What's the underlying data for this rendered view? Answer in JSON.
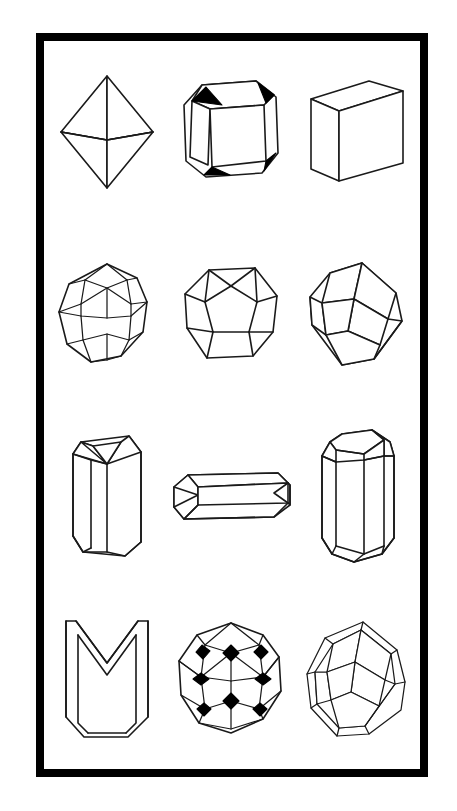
{
  "plate": {
    "background_color": "#ffffff",
    "frame_color": "#000000",
    "ink_color": "#1a1a1a",
    "accent_fill_color": "#000000",
    "frame_thickness_px": 8,
    "columns": 3,
    "rows": 4
  },
  "figures": [
    {
      "index": 1,
      "row": 1,
      "column": 1,
      "name": "octahedron",
      "label": "Octahedron",
      "description": "Eight-faced isometric form drawn as two square pyramids joined base to base, viewed with the girdle edges in perspective.",
      "icon": "octahedron-icon",
      "has_black_facets": false,
      "orientation": "vertical-axis"
    },
    {
      "index": 2,
      "row": 1,
      "column": 2,
      "name": "truncated-cube",
      "label": "Truncated Cube",
      "description": "Cube with its eight corners replaced by small triangular octahedral faces, which are shaded solid black.",
      "icon": "truncated-cube-icon",
      "has_black_facets": true,
      "black_facet_count": 4,
      "orientation": "three-quarter"
    },
    {
      "index": 3,
      "row": 1,
      "column": 3,
      "name": "cube",
      "label": "Cube",
      "description": "Simple hexahedron shown in axonometric projection with top face and left face visible.",
      "icon": "cube-icon",
      "has_black_facets": false,
      "orientation": "three-quarter"
    },
    {
      "index": 4,
      "row": 2,
      "column": 1,
      "name": "trapezohedron",
      "label": "Trapezohedron",
      "description": "Twenty-four faced isometric form (icositetrahedron) with trapezoidal faces arranged about a vertical axis.",
      "icon": "trapezohedron-icon",
      "has_black_facets": false,
      "orientation": "vertical-axis"
    },
    {
      "index": 5,
      "row": 2,
      "column": 2,
      "name": "pyritohedron",
      "label": "Pentagonal Dodecahedron",
      "description": "Twelve-faced pyritohedron built of irregular pentagonal faces, shown with five faces visible.",
      "icon": "pentagonal-dodecahedron-icon",
      "has_black_facets": false,
      "orientation": "face-forward"
    },
    {
      "index": 6,
      "row": 2,
      "column": 3,
      "name": "rhombic-dodecahedron",
      "label": "Rhombic Dodecahedron",
      "description": "Twelve rhombic faces meeting three and four at a time, tipped so a vertex points upward.",
      "icon": "rhombic-dodecahedron-icon",
      "has_black_facets": false,
      "orientation": "vertex-up"
    },
    {
      "index": 7,
      "row": 3,
      "column": 1,
      "name": "hexagonal-prism-pyramid",
      "label": "Hexagonal Prism with Pyramid",
      "description": "Vertical hexagonal prism closed at the top by a low pyramid termination and flat at the base.",
      "icon": "hexagonal-prism-icon",
      "has_black_facets": false,
      "orientation": "upright"
    },
    {
      "index": 8,
      "row": 3,
      "column": 2,
      "name": "elongated-prism",
      "label": "Elongated Prism",
      "description": "Long horizontal prism with bevelled end faces, lying on its side across the cell.",
      "icon": "elongated-prism-icon",
      "has_black_facets": false,
      "orientation": "horizontal"
    },
    {
      "index": 9,
      "row": 3,
      "column": 3,
      "name": "prismatic-crystal",
      "label": "Prismatic Crystal",
      "description": "Tall prismatic habit with multiple vertical prism faces and bevelled terminations top and bottom.",
      "icon": "prismatic-crystal-icon",
      "has_black_facets": false,
      "orientation": "upright"
    },
    {
      "index": 10,
      "row": 4,
      "column": 1,
      "name": "contact-twin",
      "label": "Contact Twin",
      "description": "Chevron or arrowhead twinned crystal: two prismatic individuals joined along a re-entrant composition plane.",
      "icon": "contact-twin-icon",
      "has_black_facets": false,
      "orientation": "upright"
    },
    {
      "index": 11,
      "row": 4,
      "column": 2,
      "name": "hexoctahedron",
      "label": "Hexoctahedron",
      "description": "Complex many-faced isometric form with small rhombic facets at the vertices shaded solid black.",
      "icon": "hexoctahedron-icon",
      "has_black_facets": true,
      "black_facet_count": 8,
      "orientation": "vertical-axis"
    },
    {
      "index": 12,
      "row": 4,
      "column": 3,
      "name": "bevelled-rhombic-dodecahedron",
      "label": "Bevelled Rhombic Dodecahedron",
      "description": "Rhombic dodecahedron whose edges are truncated by narrow bevel faces, giving a doubled outline.",
      "icon": "bevelled-rhombic-dodecahedron-icon",
      "has_black_facets": false,
      "orientation": "vertex-up"
    }
  ]
}
